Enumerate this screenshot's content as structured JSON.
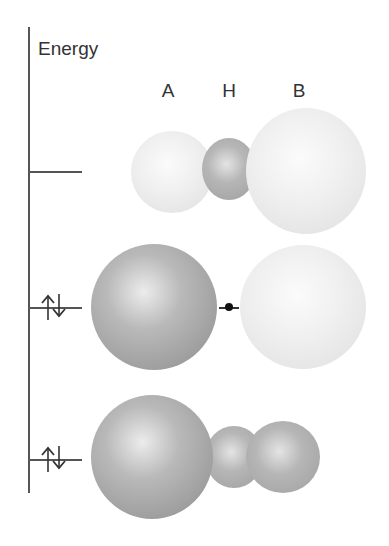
{
  "axis": {
    "label": "Energy"
  },
  "atom_labels": [
    "A",
    "H",
    "B"
  ],
  "levels": [
    {
      "name": "antibonding",
      "electrons": 0
    },
    {
      "name": "nonbonding",
      "electrons": 2,
      "electron_symbol": "↑↓"
    },
    {
      "name": "bonding",
      "electrons": 2,
      "electron_symbol": "↑↓"
    }
  ],
  "colors": {
    "axis": "#555555",
    "light_lobe": "#efefef",
    "dark_lobe": "#a8a8a8",
    "node_dot": "#111111"
  }
}
